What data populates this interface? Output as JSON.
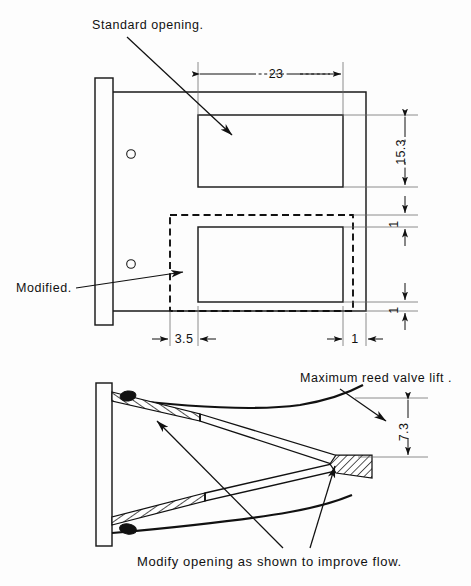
{
  "drawing": {
    "title": "Reed valve cage opening modification",
    "sheet_background": "#fdfdfd",
    "line_color": "#111111"
  },
  "annotations": {
    "standard_opening": "Standard  opening.",
    "modified": "Modified.",
    "max_reed_valve_lift": "Maximum reed valve lift .",
    "caption": "Modify  opening  as  shown  to  improve  flow."
  },
  "dimensions": {
    "width_23": "23",
    "height_15_3": "15.3",
    "offset_3_5": "3.5",
    "edge_1_right": "1",
    "gap_1_upper": "1",
    "gap_1_lower": "1",
    "lift_7_3": "7.3"
  },
  "views": {
    "front": {
      "name": "front-view",
      "flange": {
        "x": 95,
        "y": 78,
        "w": 18,
        "h": 247
      },
      "body": {
        "x": 113,
        "y": 92,
        "w": 253,
        "h": 219
      },
      "standard_opening_rect": {
        "x": 198,
        "y": 115,
        "w": 145,
        "h": 72
      },
      "modified_opening_rect": {
        "x": 198,
        "y": 227,
        "w": 145,
        "h": 75
      },
      "modified_dashed_rect": {
        "x": 170,
        "y": 215,
        "w": 183,
        "h": 96
      },
      "bolt_holes": [
        {
          "cx": 131,
          "cy": 154,
          "r": 4.2
        },
        {
          "cx": 131,
          "cy": 264,
          "r": 4.2
        }
      ]
    },
    "side": {
      "name": "side-section-view",
      "flange": {
        "x": 96,
        "y": 383,
        "w": 16,
        "h": 163
      },
      "apex_x": 368,
      "lift_dim_top_y": 398,
      "lift_dim_bottom_y": 457
    }
  }
}
